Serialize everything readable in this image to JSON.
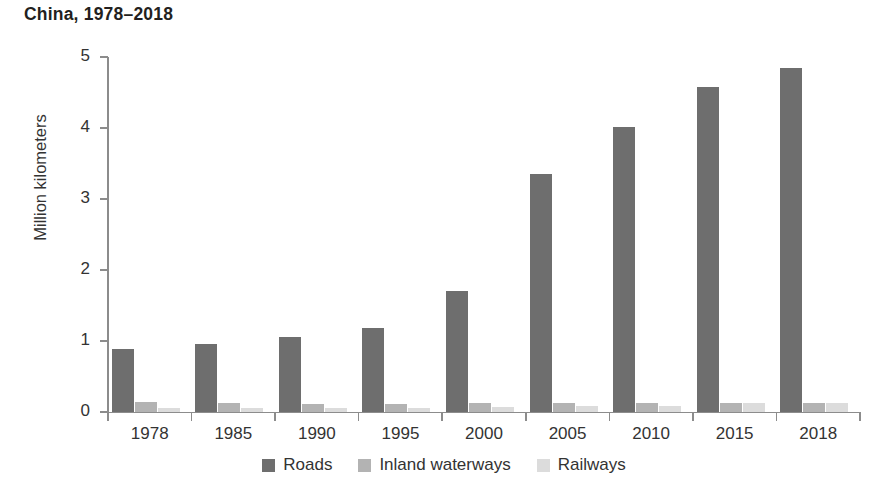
{
  "chart_data": {
    "type": "bar",
    "title": "China, 1978–2018",
    "xlabel": "",
    "ylabel": "Million kilometers",
    "ylim": [
      0,
      5
    ],
    "yticks": [
      0,
      1,
      2,
      3,
      4,
      5
    ],
    "ytick_labels": [
      "0",
      "1",
      "2",
      "3",
      "4",
      "5"
    ],
    "grid": false,
    "legend_position": "bottom",
    "categories": [
      "1978",
      "1985",
      "1990",
      "1995",
      "2000",
      "2005",
      "2010",
      "2015",
      "2018"
    ],
    "series": [
      {
        "name": "Roads",
        "color": "#6e6e6e",
        "values": [
          0.89,
          0.96,
          1.06,
          1.18,
          1.7,
          3.35,
          4.01,
          4.58,
          4.85
        ]
      },
      {
        "name": "Inland waterways",
        "color": "#b3b3b3",
        "values": [
          0.14,
          0.12,
          0.11,
          0.11,
          0.12,
          0.12,
          0.12,
          0.13,
          0.13
        ]
      },
      {
        "name": "Railways",
        "color": "#dcdcdc",
        "values": [
          0.05,
          0.05,
          0.06,
          0.06,
          0.07,
          0.08,
          0.09,
          0.12,
          0.13
        ]
      }
    ]
  },
  "colors": {
    "axis": "#8c8c8c",
    "text": "#333333",
    "title": "#231f20",
    "background": "#ffffff"
  }
}
